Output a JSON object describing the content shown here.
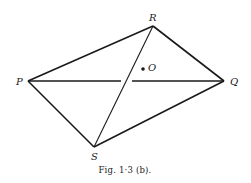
{
  "figure": {
    "caption": "Fig. 1·3 (b).",
    "points": {
      "P": {
        "label": "P",
        "x": 28,
        "y": 81
      },
      "Q": {
        "label": "Q",
        "x": 224,
        "y": 81
      },
      "R": {
        "label": "R",
        "x": 153,
        "y": 26
      },
      "S": {
        "label": "S",
        "x": 94,
        "y": 147
      },
      "O": {
        "label": "O",
        "x": 143,
        "y": 69
      }
    },
    "edges": [
      "PR",
      "RQ",
      "QS",
      "SP"
    ],
    "diagonals": [
      "PQ",
      "RS"
    ],
    "colors": {
      "line": "#1a1a1a",
      "background": "#ffffff"
    }
  }
}
